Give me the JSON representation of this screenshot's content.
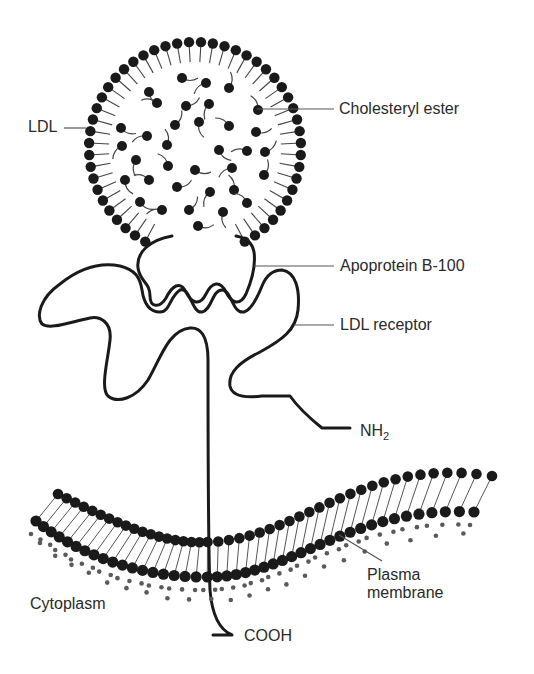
{
  "figure": {
    "colors": {
      "ink": "#1a1a1a",
      "leader": "#555555",
      "dots": "#5a5a5a",
      "background": "#ffffff"
    }
  },
  "labels": {
    "ldl": "LDL",
    "cholesteryl_ester": "Cholesteryl ester",
    "apoprotein": "Apoprotein B-100",
    "ldl_receptor": "LDL receptor",
    "nh2_main": "NH",
    "nh2_sub": "2",
    "cytoplasm": "Cytoplasm",
    "plasma_membrane_line1": "Plasma",
    "plasma_membrane_line2": "membrane",
    "cooh": "COOH"
  },
  "ldl_particle": {
    "center": [
      195,
      148
    ],
    "radius": 106,
    "head_radius": 5.2,
    "shell_heads": 48,
    "gap_start_deg": 62,
    "gap_end_deg": 118,
    "core_esters": [
      [
        182,
        78
      ],
      [
        206,
        83
      ],
      [
        229,
        88
      ],
      [
        149,
        92
      ],
      [
        157,
        103
      ],
      [
        186,
        106
      ],
      [
        209,
        104
      ],
      [
        258,
        110
      ],
      [
        121,
        128
      ],
      [
        147,
        136
      ],
      [
        175,
        125
      ],
      [
        199,
        122
      ],
      [
        229,
        126
      ],
      [
        256,
        132
      ],
      [
        122,
        146
      ],
      [
        167,
        145
      ],
      [
        219,
        150
      ],
      [
        247,
        151
      ],
      [
        265,
        152
      ],
      [
        136,
        160
      ],
      [
        168,
        166
      ],
      [
        195,
        170
      ],
      [
        232,
        168
      ],
      [
        264,
        175
      ],
      [
        125,
        180
      ],
      [
        149,
        180
      ],
      [
        177,
        187
      ],
      [
        210,
        192
      ],
      [
        234,
        190
      ],
      [
        140,
        202
      ],
      [
        162,
        210
      ],
      [
        189,
        210
      ],
      [
        223,
        212
      ],
      [
        247,
        203
      ],
      [
        198,
        226
      ]
    ]
  },
  "membrane": {
    "bilayer_heads_per_leaflet": 44
  }
}
